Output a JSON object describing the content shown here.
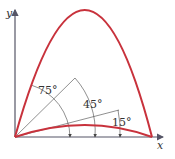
{
  "figure": {
    "axes": {
      "x_label": "x",
      "y_label": "y"
    },
    "angles": [
      {
        "label": "75°",
        "value": 75
      },
      {
        "label": "45°",
        "value": 45
      },
      {
        "label": "15°",
        "value": 15
      }
    ],
    "colors": {
      "trajectory": "#c8323c",
      "axis": "#555566",
      "guide": "#444444"
    },
    "trajectories": [
      {
        "name": "75-degree-trajectory",
        "launch_angle": 75
      },
      {
        "name": "15-degree-trajectory",
        "launch_angle": 15
      }
    ]
  }
}
